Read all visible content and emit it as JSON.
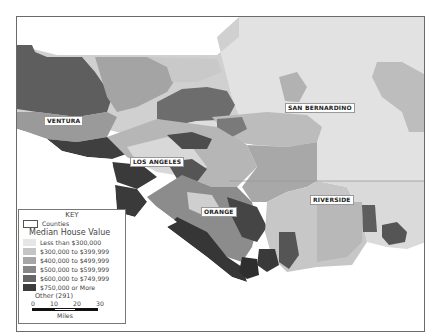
{
  "map": {
    "title": "Median House Value by Census Tract, Southern California",
    "frame_color": "#6a6a6a",
    "county_labels": [
      {
        "name": "VENTURA",
        "x": 27,
        "y": 99
      },
      {
        "name": "LOS ANGELES",
        "x": 113,
        "y": 140
      },
      {
        "name": "ORANGE",
        "x": 184,
        "y": 190
      },
      {
        "name": "SAN BERNARDINO",
        "x": 268,
        "y": 86
      },
      {
        "name": "RIVERSIDE",
        "x": 293,
        "y": 178
      }
    ]
  },
  "legend": {
    "key_title": "KEY",
    "counties_label": "Counties",
    "heading": "Median House Value",
    "classes": [
      {
        "label": "Less than $300,000",
        "color": "#e6e6e6"
      },
      {
        "label": "$300,000 to $399,999",
        "color": "#c4c4c4"
      },
      {
        "label": "$400,000 to $499,999",
        "color": "#a6a6a6"
      },
      {
        "label": "$500,000 to $599,999",
        "color": "#878787"
      },
      {
        "label": "$600,000 to $749,999",
        "color": "#666666"
      },
      {
        "label": "$750,000 or More",
        "color": "#3c3c3c"
      }
    ],
    "other_label": "Other (291)",
    "scale": {
      "ticks": [
        "0",
        "10",
        "20",
        "30"
      ],
      "units": "Miles"
    }
  }
}
